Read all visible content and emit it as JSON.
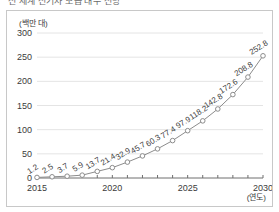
{
  "figure": {
    "title_clipped": "전 세계 전기차 보급 대수 전망",
    "background_color": "#ffffff",
    "border_color": "#c8c8c8"
  },
  "chart_data": {
    "type": "line",
    "title": "",
    "xlabel": "(연도)",
    "ylabel": "(백만 대)",
    "x": [
      2015,
      2016,
      2017,
      2018,
      2019,
      2020,
      2021,
      2022,
      2023,
      2024,
      2025,
      2026,
      2027,
      2028,
      2029,
      2030
    ],
    "values": [
      1.2,
      2.5,
      3.7,
      5.9,
      13.7,
      21.4,
      32.9,
      45.7,
      60.3,
      77.4,
      97.9,
      118.2,
      142.8,
      172.6,
      208.8,
      252.8
    ],
    "point_labels": [
      "1.2",
      "2.5",
      "3.7",
      "5.9",
      "13.7",
      "21.4",
      "32.9",
      "45.7",
      "60.3",
      "77.4",
      "97.9",
      "118.2",
      "142.8",
      "172.6",
      "208.8",
      "252.8"
    ],
    "categories": [
      "2015",
      "2016",
      "2017",
      "2018",
      "2019",
      "2020",
      "2021",
      "2022",
      "2023",
      "2024",
      "2025",
      "2026",
      "2027",
      "2028",
      "2029",
      "2030"
    ],
    "xtick_labels": [
      "2015",
      "2020",
      "2025",
      "2030"
    ],
    "xtick_values": [
      2015,
      2020,
      2025,
      2030
    ],
    "ytick_labels": [
      "0",
      "50",
      "100",
      "150",
      "200",
      "250",
      "300"
    ],
    "ytick_values": [
      0,
      50,
      100,
      150,
      200,
      250,
      300
    ],
    "xlim": [
      2015,
      2030
    ],
    "ylim": [
      0,
      300
    ],
    "grid": true,
    "grid_axis": "y",
    "legend": false,
    "line_color": "#8c8c8c",
    "marker": "circle-open",
    "marker_face_color": "#ffffff",
    "grid_color": "#e4e4e4",
    "axis_color": "#6e6e6e",
    "label_color": "#3b3b3b"
  }
}
